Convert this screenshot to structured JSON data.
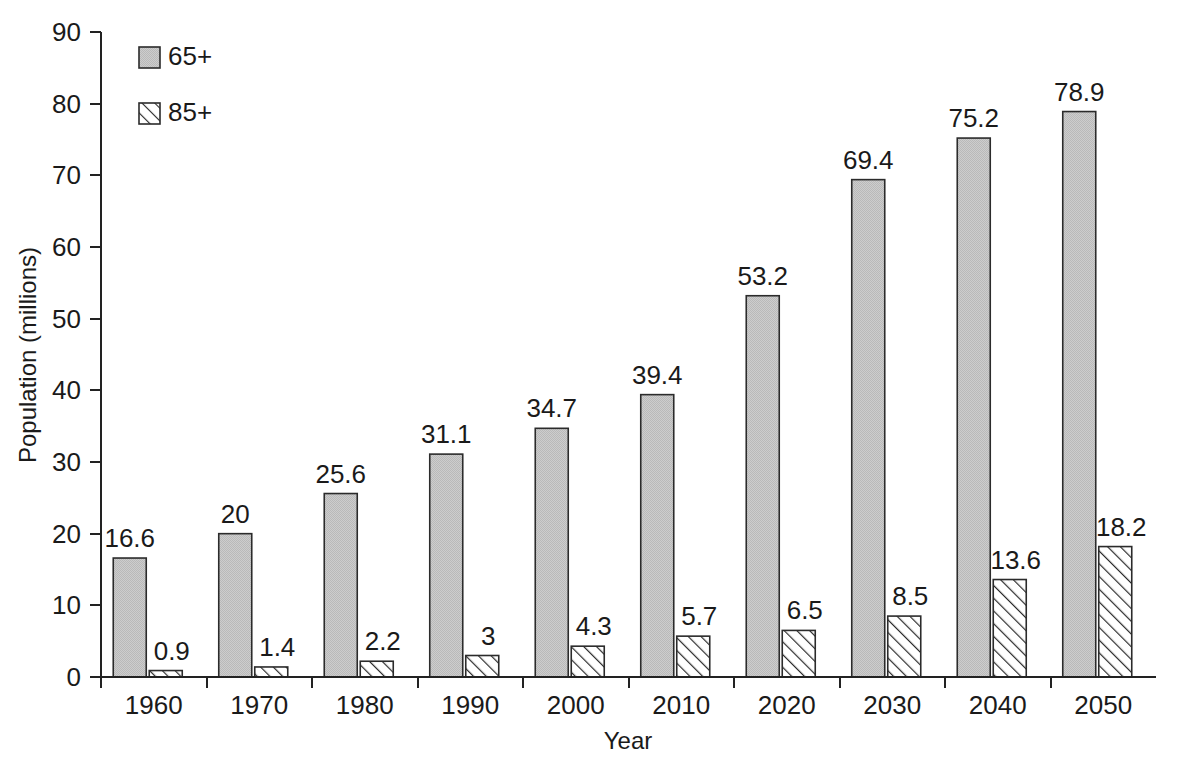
{
  "chart_data": {
    "type": "bar",
    "title": "",
    "subtitle": "",
    "xlabel": "Year",
    "ylabel": "Population (millions)",
    "categories": [
      "1960",
      "1970",
      "1980",
      "1990",
      "2000",
      "2010",
      "2020",
      "2030",
      "2040",
      "2050"
    ],
    "series": [
      {
        "name": "65+",
        "values": [
          16.6,
          20,
          25.6,
          31.1,
          34.7,
          39.4,
          53.2,
          69.4,
          75.2,
          78.9
        ],
        "value_labels": [
          "16.6",
          "20",
          "25.6",
          "31.1",
          "34.7",
          "39.4",
          "53.2",
          "69.4",
          "75.2",
          "78.9"
        ],
        "fill": "#c9c9c9",
        "pattern": "solid-gray",
        "outline": "#2b2b2b"
      },
      {
        "name": "85+",
        "values": [
          0.9,
          1.4,
          2.2,
          3,
          4.3,
          5.7,
          6.5,
          8.5,
          13.6,
          18.2
        ],
        "value_labels": [
          "0.9",
          "1.4",
          "2.2",
          "3",
          "4.3",
          "5.7",
          "6.5",
          "8.5",
          "13.6",
          "18.2"
        ],
        "fill": "#ffffff",
        "pattern": "diagonal-hatch",
        "outline": "#2b2b2b"
      }
    ],
    "ylim": [
      0,
      90
    ],
    "yticks": [
      0,
      10,
      20,
      30,
      40,
      50,
      60,
      70,
      80,
      90
    ],
    "ytick_labels": [
      "0",
      "10",
      "20",
      "30",
      "40",
      "50",
      "60",
      "70",
      "80",
      "90"
    ],
    "grid": false,
    "legend_position": "top-left",
    "legend_entries": [
      {
        "label": "65+",
        "pattern": "solid-gray"
      },
      {
        "label": "85+",
        "pattern": "diagonal-hatch"
      }
    ],
    "value_labels_shown": true,
    "background_color": "#ffffff",
    "axis_color": "#222222",
    "text_color": "#1a1a1a"
  }
}
